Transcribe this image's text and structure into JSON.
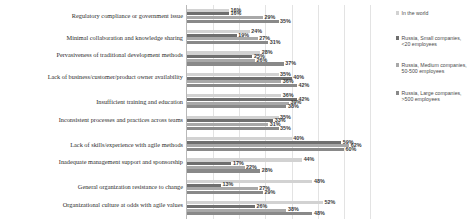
{
  "chart_data": {
    "type": "bar",
    "orientation": "horizontal",
    "title": "",
    "xlabel": "",
    "ylabel": "",
    "xlim": [
      0,
      70
    ],
    "grid": true,
    "grid_axis": "x",
    "legend_position": "right",
    "value_suffix": "%",
    "categories": [
      "Regulatory compliance or government issue",
      "Minimal collaboration and knowledge sharing",
      "Pervasiveness of traditional development methods",
      "Lack of business/customer/product owner availability",
      "Insufficient training and education",
      "Inconsistent processes and practices across teams",
      "Lack of skills/experience with agile methods",
      "Inadequate management support and sponsorship",
      "General organization resistance to change",
      "Organizational culture at odds with agile values"
    ],
    "series": [
      {
        "name": "In the world",
        "color": "#d2d2d2",
        "values": [
          16,
          24,
          28,
          35,
          36,
          35,
          40,
          44,
          48,
          52
        ]
      },
      {
        "name": "Russia, Small companies, <20 employees",
        "color": "#6f6f6f",
        "values": [
          16,
          19,
          25,
          40,
          42,
          33,
          59,
          17,
          13,
          26
        ]
      },
      {
        "name": "Russia, Medium companies, 50-500 employees",
        "color": "#a8a8a8",
        "values": [
          29,
          27,
          26,
          36,
          39,
          31,
          62,
          22,
          27,
          38
        ]
      },
      {
        "name": "Russia, Large companies, >500 employees",
        "color": "#898989",
        "values": [
          35,
          31,
          37,
          42,
          38,
          35,
          60,
          28,
          29,
          48
        ]
      }
    ],
    "data_labels": [
      [
        "16%",
        "16%",
        "29%",
        "35%"
      ],
      [
        "24%",
        "19%",
        "27%",
        "31%"
      ],
      [
        "28%",
        "25%",
        "26%",
        "37%"
      ],
      [
        "35%",
        "40%",
        "36%",
        "42%"
      ],
      [
        "36%",
        "42%",
        "39%",
        "38%"
      ],
      [
        "35%",
        "33%",
        "31%",
        "35%"
      ],
      [
        "40%",
        "59%",
        "62%",
        "60%"
      ],
      [
        "44%",
        "17%",
        "22%",
        "28%"
      ],
      [
        "48%",
        "13%",
        "27%",
        "29%"
      ],
      [
        "52%",
        "26%",
        "38%",
        "48%"
      ]
    ]
  },
  "legend": {
    "items": [
      {
        "label": "In the world"
      },
      {
        "label": "Russia, Small companies, <20 employees"
      },
      {
        "label": "Russia, Medium companies, 50-500 employees"
      },
      {
        "label": "Russia, Large companies, >500 employees"
      }
    ]
  }
}
